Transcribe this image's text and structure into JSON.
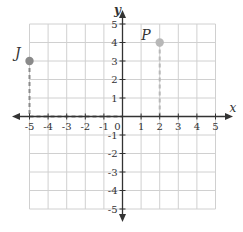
{
  "diagram": {
    "type": "coordinate-plane",
    "axes": {
      "x_label": "x",
      "y_label": "y",
      "x_range": [
        -5,
        5
      ],
      "y_range": [
        -5,
        5
      ],
      "x_ticks": [
        "-5",
        "-4",
        "-3",
        "-2",
        "-1",
        "0",
        "1",
        "2",
        "3",
        "4",
        "5"
      ],
      "y_ticks": [
        "5",
        "4",
        "3",
        "2",
        "1",
        "-1",
        "-2",
        "-3",
        "-4",
        "-5"
      ],
      "origin_label": "0"
    },
    "points": [
      {
        "label": "J",
        "x": -5,
        "y": 3,
        "color": "#8a8a8a"
      },
      {
        "label": "P",
        "x": 2,
        "y": 4,
        "color": "#b8b8b8"
      }
    ],
    "guides": [
      {
        "from": [
          -5,
          3
        ],
        "to": [
          -5,
          0
        ],
        "style": "dashed",
        "color": "#8a8a8a"
      },
      {
        "from": [
          -5,
          0
        ],
        "to": [
          0,
          0
        ],
        "style": "dashed",
        "color": "#8a8a8a"
      },
      {
        "from": [
          2,
          4
        ],
        "to": [
          2,
          0
        ],
        "style": "dashed",
        "color": "#b8b8b8"
      }
    ],
    "colors": {
      "grid": "#d0d0d0",
      "axis": "#333333",
      "text": "#333333"
    }
  }
}
